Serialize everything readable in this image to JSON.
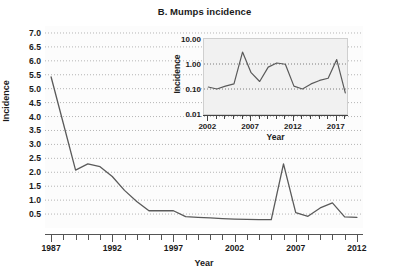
{
  "figure": {
    "panel_label": "B.",
    "title": "B.  Mumps incidence",
    "background": "#ffffff",
    "line_color": "#5a5a5a"
  },
  "chart_data": [
    {
      "id": "main",
      "type": "line",
      "title": "B.  Mumps incidence",
      "xlabel": "Year",
      "ylabel": "Incidence",
      "xlim": [
        1986.5,
        2012.5
      ],
      "ylim": [
        0.0,
        7.25
      ],
      "yticks": [
        "0.5",
        "1.0",
        "1.5",
        "2.0",
        "2.5",
        "3.0",
        "3.5",
        "4.0",
        "4.5",
        "5.0",
        "5.5",
        "6.0",
        "6.5",
        "7.0"
      ],
      "ytick_values": [
        0.5,
        1.0,
        1.5,
        2.0,
        2.5,
        3.0,
        3.5,
        4.0,
        4.5,
        5.0,
        5.5,
        6.0,
        6.5,
        7.0
      ],
      "xticks": [
        "1987",
        "1992",
        "1997",
        "2002",
        "2007",
        "2012"
      ],
      "xtick_values": [
        1987,
        1992,
        1997,
        2002,
        2007,
        2012
      ],
      "xtick_minor_step": 1,
      "grid": "horizontal-dotted",
      "legend": "none",
      "x": [
        1987,
        1988,
        1989,
        1990,
        1991,
        1992,
        1993,
        1994,
        1995,
        1996,
        1997,
        1998,
        1999,
        2000,
        2001,
        2002,
        2003,
        2004,
        2005,
        2006,
        2007,
        2008,
        2009,
        2010,
        2011,
        2012
      ],
      "values": [
        5.42,
        3.75,
        2.08,
        2.3,
        2.2,
        1.85,
        1.35,
        0.95,
        0.62,
        0.62,
        0.62,
        0.41,
        0.38,
        0.36,
        0.34,
        0.32,
        0.31,
        0.3,
        0.3,
        2.3,
        0.55,
        0.42,
        0.72,
        0.9,
        0.4,
        0.38
      ]
    },
    {
      "id": "inset",
      "type": "line",
      "xlabel": "Year",
      "ylabel": "Incidence",
      "yscale": "log",
      "xlim": [
        2001.5,
        2018.2
      ],
      "ylim": [
        0.01,
        10.0
      ],
      "yticks": [
        "0.01",
        "0.10",
        "1.00",
        "10.00"
      ],
      "ytick_values": [
        0.01,
        0.1,
        1.0,
        10.0
      ],
      "xticks": [
        "2002",
        "2007",
        "2012",
        "2017"
      ],
      "xtick_values": [
        2002,
        2007,
        2012,
        2017
      ],
      "xtick_minor_step": 1,
      "grid": "horizontal-dotted",
      "legend": "none",
      "x": [
        2002,
        2003,
        2004,
        2005,
        2006,
        2007,
        2008,
        2009,
        2010,
        2011,
        2012,
        2013,
        2014,
        2015,
        2016,
        2017,
        2018
      ],
      "values": [
        0.12,
        0.1,
        0.13,
        0.16,
        3.0,
        0.45,
        0.2,
        0.75,
        1.1,
        0.98,
        0.13,
        0.1,
        0.16,
        0.22,
        0.27,
        1.5,
        0.07
      ]
    }
  ]
}
